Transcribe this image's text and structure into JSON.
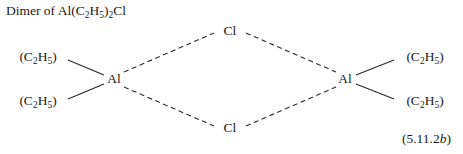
{
  "title": {
    "prefix": "Dimer of Al(C",
    "sub1": "2",
    "mid1": "H",
    "sub2": "5",
    "mid2": ")",
    "sub3": "2",
    "suffix": "Cl",
    "plain": "Dimer of Al(C2H5)2Cl"
  },
  "equation_number": {
    "roman": "(5.11.2",
    "italic": "b",
    "close": ")",
    "plain": "(5.11.2b)"
  },
  "structure": {
    "type": "chemical-structure-dimer",
    "description": "Chlorine-bridged dimer of diethylaluminium chloride",
    "bond_color": "#2a2a2a",
    "atoms": [
      {
        "id": "al-left",
        "label": "Al",
        "x": 114,
        "y": 79
      },
      {
        "id": "al-right",
        "label": "Al",
        "x": 345,
        "y": 79
      },
      {
        "id": "cl-top",
        "label": "Cl",
        "x": 230,
        "y": 31
      },
      {
        "id": "cl-bottom",
        "label": "Cl",
        "x": 230,
        "y": 128
      }
    ],
    "groups": [
      {
        "id": "ethyl-top-left",
        "open": "(C",
        "sub1": "2",
        "mid": "H",
        "sub2": "5",
        "close": ")",
        "plain": "(C2H5)",
        "x": 38,
        "y": 57
      },
      {
        "id": "ethyl-bottom-left",
        "open": "(C",
        "sub1": "2",
        "mid": "H",
        "sub2": "5",
        "close": ")",
        "plain": "(C2H5)",
        "x": 38,
        "y": 101
      },
      {
        "id": "ethyl-top-right",
        "open": "(C",
        "sub1": "2",
        "mid": "H",
        "sub2": "5",
        "close": ")",
        "plain": "(C2H5)",
        "x": 425,
        "y": 57
      },
      {
        "id": "ethyl-bottom-right",
        "open": "(C",
        "sub1": "2",
        "mid": "H",
        "sub2": "5",
        "close": ")",
        "plain": "(C2H5)",
        "x": 425,
        "y": 101
      }
    ],
    "bonds": [
      {
        "id": "bond-al-left-ethyl-top",
        "style": "solid",
        "x1": 68,
        "y1": 60,
        "x2": 104,
        "y2": 75
      },
      {
        "id": "bond-al-left-ethyl-bottom",
        "style": "solid",
        "x1": 68,
        "y1": 99,
        "x2": 104,
        "y2": 84
      },
      {
        "id": "bond-al-right-ethyl-top",
        "style": "solid",
        "x1": 356,
        "y1": 75,
        "x2": 394,
        "y2": 60
      },
      {
        "id": "bond-al-right-ethyl-bottom",
        "style": "solid",
        "x1": 356,
        "y1": 84,
        "x2": 394,
        "y2": 99
      },
      {
        "id": "bridge-al-left-cl-top",
        "style": "dashed",
        "x1": 124,
        "y1": 72,
        "x2": 214,
        "y2": 33
      },
      {
        "id": "bridge-cl-top-al-right",
        "style": "dashed",
        "x1": 246,
        "y1": 33,
        "x2": 336,
        "y2": 72
      },
      {
        "id": "bridge-al-left-cl-bottom",
        "style": "dashed",
        "x1": 124,
        "y1": 87,
        "x2": 214,
        "y2": 126
      },
      {
        "id": "bridge-cl-bottom-al-right",
        "style": "dashed",
        "x1": 246,
        "y1": 126,
        "x2": 336,
        "y2": 87
      }
    ]
  }
}
